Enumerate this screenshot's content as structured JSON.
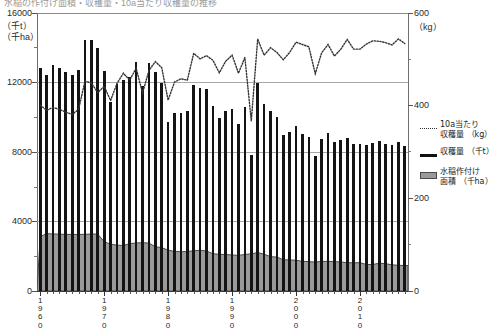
{
  "title_strip": "水稲の作付け面積・収穫量・10a当たり収穫量の推移",
  "axis": {
    "left_unit_line1": "（千t）",
    "left_unit_line2": "（千ha）",
    "left_ticks": [
      "0",
      "4000",
      "8000",
      "12000",
      "16000"
    ],
    "left_min": 0,
    "left_max": 16000,
    "right_unit": "（kg）",
    "right_ticks": [
      "0",
      "200",
      "400",
      "600"
    ],
    "right_min": 0,
    "right_max": 600,
    "x_ticks": [
      "1960",
      "1970",
      "1980",
      "1990",
      "2000",
      "2010"
    ]
  },
  "legend": {
    "items": [
      {
        "key": "dotted",
        "label": "10a当たり\n収穫量 （kg）",
        "name": "yield-per-10a"
      },
      {
        "key": "solid",
        "label": "収穫量 （千t）",
        "name": "production"
      },
      {
        "key": "box",
        "label": "水稲作付け\n面積 （千ha）",
        "name": "planted-area"
      }
    ]
  },
  "colors": {
    "bar": "#141414",
    "area_fill": "#9a9a9a",
    "area_line": "#4a4a4a",
    "dotted_line": "#333333",
    "grid": "#a8a8a8",
    "axis": "#555555"
  },
  "chart_data": {
    "type": "bar",
    "title": "水稲の作付け面積・収穫量・10a当たり収穫量の推移",
    "xlabel": "",
    "ylabel": "収穫量（千t）／水稲作付け面積（千ha）",
    "y2label": "10a当たり収穫量（kg）",
    "ylim": [
      0,
      16000
    ],
    "y2lim": [
      0,
      600
    ],
    "grid": true,
    "legend_position": "right",
    "x": [
      1960,
      1961,
      1962,
      1963,
      1964,
      1965,
      1966,
      1967,
      1968,
      1969,
      1970,
      1971,
      1972,
      1973,
      1974,
      1975,
      1976,
      1977,
      1978,
      1979,
      1980,
      1981,
      1982,
      1983,
      1984,
      1985,
      1986,
      1987,
      1988,
      1989,
      1990,
      1991,
      1992,
      1993,
      1994,
      1995,
      1996,
      1997,
      1998,
      1999,
      2000,
      2001,
      2002,
      2003,
      2004,
      2005,
      2006,
      2007,
      2008,
      2009,
      2010,
      2011,
      2012,
      2013,
      2014,
      2015,
      2016,
      2017
    ],
    "series": [
      {
        "name": "収穫量 （千t）",
        "type": "bar",
        "axis": "left",
        "unit": "千t",
        "values": [
          12858,
          12419,
          13009,
          12812,
          12584,
          12409,
          12745,
          14453,
          14449,
          14003,
          12689,
          10887,
          11897,
          12149,
          12292,
          13165,
          11772,
          13095,
          12589,
          11958,
          9751,
          10259,
          10270,
          10366,
          11878,
          11662,
          11647,
          10627,
          9935,
          10347,
          10499,
          9604,
          10573,
          7834,
          11981,
          10748,
          10344,
          10025,
          8960,
          9175,
          9490,
          9057,
          8889,
          7792,
          8730,
          9074,
          8556,
          8714,
          8823,
          8474,
          8483,
          8402,
          8523,
          8607,
          8439,
          8429,
          8550,
          8324
        ]
      },
      {
        "name": "水稲作付け面積 （千ha）",
        "type": "area",
        "axis": "left",
        "unit": "千ha",
        "values": [
          3124,
          3301,
          3286,
          3272,
          3260,
          3255,
          3254,
          3263,
          3280,
          3274,
          2836,
          2695,
          2640,
          2620,
          2724,
          2764,
          2779,
          2757,
          2548,
          2497,
          2350,
          2278,
          2257,
          2273,
          2315,
          2342,
          2303,
          2146,
          2110,
          2097,
          2074,
          2049,
          2106,
          2139,
          2212,
          2118,
          1977,
          1953,
          1801,
          1788,
          1770,
          1706,
          1688,
          1665,
          1701,
          1706,
          1688,
          1673,
          1627,
          1624,
          1628,
          1526,
          1524,
          1599,
          1573,
          1506,
          1478,
          1466
        ]
      },
      {
        "name": "10a当たり収穫量 （kg）",
        "type": "line",
        "style": "dotted",
        "axis": "right",
        "unit": "kg",
        "values": [
          401,
          390,
          396,
          392,
          386,
          381,
          392,
          453,
          449,
          428,
          442,
          411,
          448,
          470,
          455,
          481,
          427,
          476,
          495,
          482,
          412,
          451,
          458,
          455,
          513,
          501,
          508,
          498,
          471,
          496,
          509,
          470,
          504,
          367,
          544,
          509,
          525,
          515,
          499,
          515,
          537,
          532,
          527,
          469,
          514,
          532,
          507,
          522,
          543,
          522,
          522,
          533,
          540,
          539,
          536,
          531,
          544,
          534
        ]
      }
    ]
  }
}
